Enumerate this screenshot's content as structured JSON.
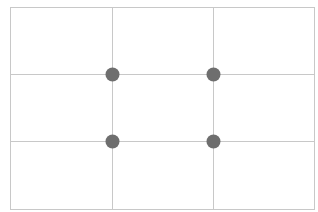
{
  "diagram": {
    "frame": {
      "x": 10,
      "y": 7,
      "width": 304,
      "height": 202
    },
    "vertical_lines_x": [
      112,
      213
    ],
    "horizontal_lines_y": [
      74,
      141
    ],
    "intersection_points": [
      {
        "x": 112,
        "y": 74
      },
      {
        "x": 213,
        "y": 74
      },
      {
        "x": 112,
        "y": 141
      },
      {
        "x": 213,
        "y": 141
      }
    ],
    "colors": {
      "background": "#ffffff",
      "grid_line": "#c8c8c8",
      "point": "#6e6e6e"
    },
    "point_radius": 7
  }
}
